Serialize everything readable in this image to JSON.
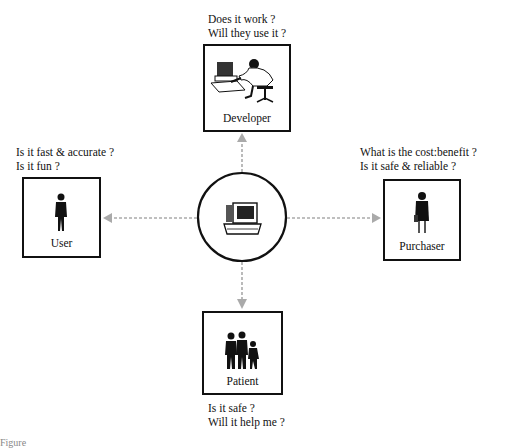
{
  "diagram": {
    "center": {
      "label": "computer",
      "icon": "computer-icon"
    },
    "nodes": {
      "developer": {
        "label": "Developer",
        "questions": [
          "Does it work ?",
          "Will they use it ?"
        ]
      },
      "user": {
        "label": "User",
        "questions": [
          "Is it fast & accurate ?",
          "Is it fun ?"
        ]
      },
      "purchaser": {
        "label": "Purchaser",
        "questions": [
          "What is the cost:benefit ?",
          "Is it safe & reliable ?"
        ]
      },
      "patient": {
        "label": "Patient",
        "questions": [
          "Is it safe ?",
          "Will it help me ?"
        ]
      }
    },
    "caption": "Figure"
  }
}
